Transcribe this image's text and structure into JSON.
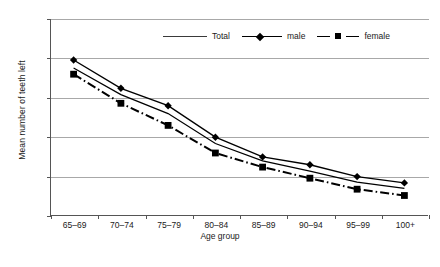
{
  "chart_data": {
    "type": "line",
    "title": "",
    "xlabel": "Age group",
    "ylabel": "Mean number of teeth left",
    "categories": [
      "65–69",
      "70–74",
      "75–79",
      "80–84",
      "85–89",
      "90–94",
      "95–99",
      "100+"
    ],
    "ylim": [
      0,
      25
    ],
    "yticks": [
      0,
      5,
      10,
      15,
      20,
      25
    ],
    "grid": true,
    "legend_position": "top-center",
    "series": [
      {
        "name": "Total",
        "marker": "none",
        "style": "solid",
        "values": [
          18.8,
          15.4,
          13.0,
          9.2,
          7.0,
          5.7,
          4.3,
          3.5
        ]
      },
      {
        "name": "male",
        "marker": "diamond",
        "style": "solid",
        "values": [
          19.8,
          16.2,
          14.0,
          10.0,
          7.5,
          6.5,
          5.0,
          4.2
        ]
      },
      {
        "name": "female",
        "marker": "square",
        "style": "dashdot",
        "values": [
          18.0,
          14.3,
          11.5,
          8.0,
          6.2,
          4.8,
          3.4,
          2.6
        ]
      }
    ]
  },
  "axis": {
    "y_title": "Mean number of teeth left",
    "x_title": "Age group",
    "y_tick_labels": [
      "25",
      "20",
      "15",
      "10",
      "5",
      "0"
    ]
  },
  "legend": {
    "total_label": "Total",
    "male_label": "male",
    "female_label": "female"
  },
  "caption": {
    "text": ""
  }
}
